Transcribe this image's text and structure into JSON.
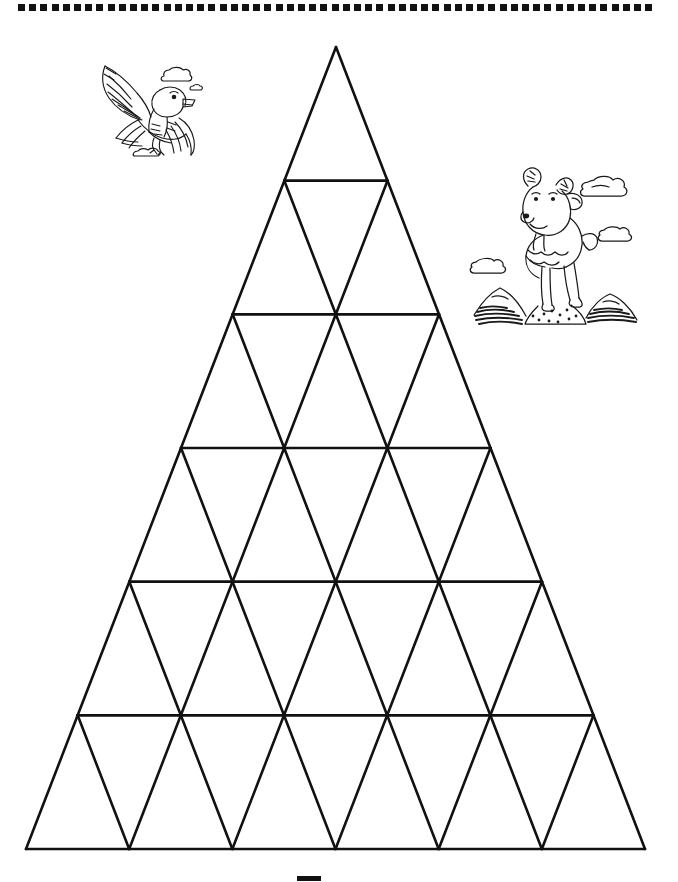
{
  "page": {
    "title": "Triangle Grid Mountain Worksheet",
    "background_color": "#ffffff",
    "ink_color": "#111111",
    "width": 678,
    "height": 882
  },
  "top_border": {
    "name": "dotted-square-border",
    "shape": "square",
    "square_size": 7,
    "pitch": 11.2,
    "count": 57,
    "start_x": 18,
    "y": 4,
    "color": "#111111"
  },
  "triangle_grid": {
    "name": "mountain-triangle-grid",
    "apex": {
      "x": 336,
      "y": 47
    },
    "left_corner": {
      "x": 26,
      "y": 849
    },
    "right_corner": {
      "x": 645,
      "y": 849
    },
    "rows": 6,
    "row_height": 133.7,
    "stroke_width": 2.6,
    "stroke_color": "#111111",
    "fill": "none",
    "row_labels": [
      "row-1",
      "row-2",
      "row-3",
      "row-4",
      "row-5",
      "row-6"
    ],
    "triangles_per_row": [
      1,
      3,
      5,
      7,
      9,
      11
    ],
    "total_triangles": 36
  },
  "clipart": [
    {
      "name": "eagle-clipart",
      "label": "Flying eagle with clouds",
      "x": 82,
      "y": 52,
      "width": 122,
      "height": 106,
      "style": "line-art"
    },
    {
      "name": "goat-clipart",
      "label": "Mountain goat standing on rocks with clouds",
      "x": 464,
      "y": 158,
      "width": 178,
      "height": 168,
      "style": "line-art"
    }
  ],
  "bottom_mark": {
    "name": "bottom-mark",
    "x": 297,
    "y": 876,
    "width": 24,
    "height": 5,
    "color": "#111111"
  }
}
